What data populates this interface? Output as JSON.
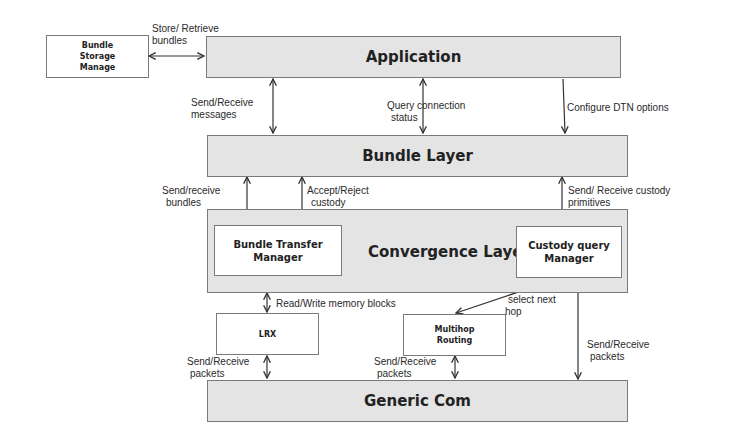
{
  "diagram": {
    "nodes": {
      "bundle_storage": "Bundle Storage Manage",
      "application": "Application",
      "bundle_layer": "Bundle Layer",
      "convergence_layer": "Convergence Layer",
      "bundle_transfer_manager": "Bundle Transfer Manager",
      "custody_query_manager": "Custody query Manager",
      "lrx": "LRX",
      "multihop_routing": "Multihop Routing",
      "generic_com": "Generic Com"
    },
    "node_lines": {
      "bundle_storage": [
        "Bundle",
        "Storage",
        "Manage"
      ],
      "bundle_transfer_manager": [
        "Bundle Transfer",
        "Manager"
      ],
      "custody_query_manager": [
        "Custody query",
        "Manager"
      ],
      "multihop_routing": [
        "Multihop",
        "Routing"
      ]
    },
    "edges": [
      {
        "from": "bundle_storage",
        "to": "application",
        "label": "Store/ Retrieve bundles",
        "direction": "both"
      },
      {
        "from": "application",
        "to": "bundle_layer",
        "label": "Send/Receive messages",
        "direction": "both"
      },
      {
        "from": "application",
        "to": "bundle_layer",
        "label": "Query connection status",
        "direction": "both"
      },
      {
        "from": "application",
        "to": "bundle_layer",
        "label": "Configure DTN options",
        "direction": "down"
      },
      {
        "from": "bundle_layer",
        "to": "bundle_transfer_manager",
        "label": "Send/receive bundles",
        "direction": "both"
      },
      {
        "from": "bundle_layer",
        "to": "bundle_transfer_manager",
        "label": "Accept/Reject custody",
        "direction": "both"
      },
      {
        "from": "bundle_layer",
        "to": "custody_query_manager",
        "label": "Send/ Receive custody primitives",
        "direction": "both"
      },
      {
        "from": "convergence_layer",
        "to": "lrx",
        "label": "Read/Write memory blocks",
        "direction": "both"
      },
      {
        "from": "custody_query_manager",
        "to": "multihop_routing",
        "label": "select next hop",
        "direction": "both"
      },
      {
        "from": "lrx",
        "to": "generic_com",
        "label": "Send/Receive packets",
        "direction": "both"
      },
      {
        "from": "multihop_routing",
        "to": "generic_com",
        "label": "Send/Receive packets",
        "direction": "both"
      },
      {
        "from": "custody_query_manager",
        "to": "generic_com",
        "label": "Send/Receive packets",
        "direction": "both"
      }
    ],
    "label_lines": {
      "store_retrieve": [
        "Store/ Retrieve",
        "bundles"
      ],
      "send_receive_messages": [
        "Send/Receive",
        "messages"
      ],
      "query_connection": [
        "Query connection",
        "status"
      ],
      "configure_dtn": [
        "Configure DTN options"
      ],
      "send_receive_bundles": [
        "Send/receive",
        "bundles"
      ],
      "accept_reject": [
        "Accept/Reject",
        "custody"
      ],
      "custody_primitives": [
        "Send/ Receive custody",
        "primitives"
      ],
      "read_write": [
        "Read/Write memory blocks"
      ],
      "select_next_hop": [
        "select next",
        "hop"
      ],
      "lrx_packets": [
        "Send/Receive",
        "packets"
      ],
      "multihop_packets": [
        "Send/Receive",
        "packets"
      ],
      "custody_packets": [
        "Send/Receive",
        "packets"
      ]
    },
    "colors": {
      "layer_fill": "#e4e4e4",
      "box_fill": "#ffffff",
      "border": "#7a7a7a",
      "arrow": "#333333"
    }
  }
}
